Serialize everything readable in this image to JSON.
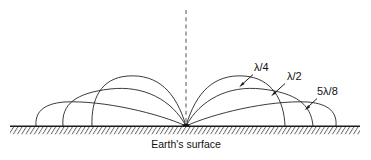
{
  "figure": {
    "caption": "Earth's surface",
    "background_color": "#ffffff",
    "line_color": "#242424",
    "ground_color": "#1b1b1b",
    "axis_color": "#6b6b6b"
  },
  "axis": {
    "name": "antenna-axis",
    "style": "dashed-vertical",
    "x": 186,
    "y_top": 10,
    "y_bottom": 126
  },
  "ground": {
    "label": "Earth's surface",
    "y": 126,
    "x_start": 10,
    "x_end": 360,
    "hatching": "diagonal"
  },
  "feed_point": {
    "name": "antenna-feed-point",
    "x": 186,
    "y": 126
  },
  "labels": [
    {
      "id": "lambda-over-4",
      "text": "λ/4",
      "x": 255,
      "y": 71,
      "leader_from": [
        253,
        74
      ],
      "leader_to": [
        240,
        86
      ]
    },
    {
      "id": "lambda-over-2",
      "text": "λ/2",
      "x": 287,
      "y": 80,
      "leader_from": [
        285,
        83
      ],
      "leader_to": [
        272,
        95
      ]
    },
    {
      "id": "five-lambda-over-8",
      "text": "5λ/8",
      "x": 318,
      "y": 95,
      "leader_from": [
        317,
        98
      ],
      "leader_to": [
        306,
        109
      ]
    }
  ],
  "chart_data": {
    "type": "line",
    "xlabel": "",
    "ylabel": "",
    "grid": false,
    "legend": [
      "λ/4",
      "λ/2",
      "5λ/8"
    ],
    "legend_position": "inline-annotations",
    "annotations": [
      "λ/4",
      "λ/2",
      "5λ/8",
      "Earth's surface"
    ],
    "series": [
      {
        "name": "λ/4",
        "description": "Quarter-wave monopole lobe: broad, tallest lobe reaching furthest along the ground",
        "right_lobe_path": "M 186 126 C 196 92 214 74 244 76 C 272 78 284 100 285 126",
        "left_lobe_path": "M 186 126 C 176 92 158 74 128 76 C 100 78 91 100 92 126",
        "ground_contact_right_x": 285,
        "ground_contact_left_x": 92,
        "peak_height_px": 50
      },
      {
        "name": "λ/2",
        "description": "Half-wave monopole lobe: narrower and shorter than the quarter-wave lobe",
        "right_lobe_path": "M 186 126 C 200 100 228 85 262 89 C 296 93 311 104 313 126",
        "left_lobe_path": "M 186 126 C 172 100 144 85 110 89 C 76 93 61 104 63 126",
        "ground_contact_right_x": 313,
        "ground_contact_left_x": 63,
        "peak_height_px": 39
      },
      {
        "name": "5λ/8",
        "description": "Five-eighths-wave monopole lobe: the flattest, shortest lobe hugging the ground",
        "right_lobe_path": "M 186 126 C 212 114 268 100 308 102 C 330 104 337 113 336 126",
        "left_lobe_path": "M 186 126 C 160 114 104 100 64 102 C 42 104 35 113 36 126",
        "ground_contact_right_x": 336,
        "ground_contact_left_x": 36,
        "peak_height_px": 25
      }
    ]
  }
}
